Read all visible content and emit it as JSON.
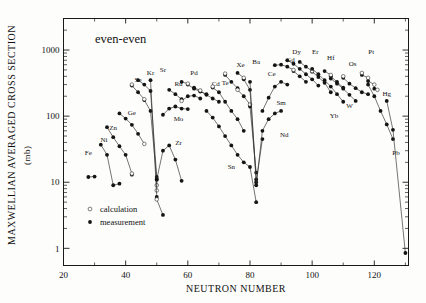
{
  "figure": {
    "title": "even-even",
    "xlabel": "NEUTRON  NUMBER",
    "ylabel": "MAXWELLIAN  AVERAGED  CROSS  SECTION",
    "yunit": "(mb)"
  },
  "legend": {
    "items": [
      {
        "marker": "open-circle",
        "label": "calculation"
      },
      {
        "marker": "filled-circle",
        "label": "measurement"
      }
    ]
  },
  "chart_data": {
    "type": "scatter",
    "title": "even-even",
    "xlabel": "NEUTRON  NUMBER",
    "ylabel": "MAXWELLIAN  AVERAGED  CROSS  SECTION (mb)",
    "xlim": [
      20,
      131
    ],
    "ylim": [
      0.55,
      3000
    ],
    "yscale": "log",
    "xticks": [
      20,
      40,
      60,
      80,
      100,
      120
    ],
    "yticks": [
      1,
      10,
      100,
      1000
    ],
    "grid": false,
    "legend_position": "lower-left-inside",
    "series": [
      {
        "name": "Fe",
        "label_x": 28,
        "label_y": 26,
        "measurement": [
          [
            28,
            12.0
          ],
          [
            30,
            12.2
          ]
        ],
        "calculation": []
      },
      {
        "name": "Ni",
        "label_x": 33,
        "label_y": 40,
        "measurement": [
          [
            32,
            37.0
          ],
          [
            34,
            26.0
          ],
          [
            36,
            9.0
          ],
          [
            38,
            9.5
          ]
        ],
        "calculation": []
      },
      {
        "name": "Zn",
        "label_x": 36,
        "label_y": 62,
        "measurement": [
          [
            34,
            68.0
          ],
          [
            36,
            48.0
          ],
          [
            38,
            35.0
          ],
          [
            40,
            26.0
          ],
          [
            42,
            13.0
          ]
        ],
        "calculation": [
          [
            42,
            13.5
          ]
        ]
      },
      {
        "name": "Ge",
        "label_x": 42,
        "label_y": 105,
        "measurement": [
          [
            38,
            110.0
          ],
          [
            40,
            92.0
          ],
          [
            42,
            74.0
          ],
          [
            44,
            54.0
          ]
        ],
        "calculation": [
          [
            46,
            38.0
          ]
        ]
      },
      {
        "name": "Se",
        "label_x": 44,
        "label_y": 330,
        "measurement": [
          [
            42,
            290.0
          ],
          [
            44,
            230.0
          ],
          [
            46,
            175.0
          ],
          [
            48,
            120.0
          ],
          [
            50,
            11.0
          ]
        ],
        "calculation": [
          [
            42,
            300.0
          ],
          [
            46,
            180.0
          ],
          [
            50,
            9.0
          ]
        ]
      },
      {
        "name": "Kr",
        "label_x": 48,
        "label_y": 420,
        "measurement": [
          [
            44,
            350.0
          ],
          [
            46,
            300.0
          ],
          [
            48,
            240.0
          ],
          [
            50,
            12.0
          ]
        ],
        "calculation": [
          [
            50,
            7.5
          ]
        ]
      },
      {
        "name": "Sr",
        "label_x": 52,
        "label_y": 470,
        "measurement": [
          [
            48,
            350.0
          ],
          [
            50,
            6.0
          ],
          [
            52,
            3.2
          ]
        ],
        "calculation": [
          [
            50,
            5.5
          ]
        ]
      },
      {
        "name": "Zr",
        "label_x": 57,
        "label_y": 36,
        "measurement": [
          [
            50,
            11.0
          ],
          [
            52,
            30.0
          ],
          [
            54,
            36.0
          ],
          [
            56,
            22.0
          ],
          [
            58,
            10.5
          ]
        ],
        "calculation": []
      },
      {
        "name": "Mo",
        "label_x": 57,
        "label_y": 85,
        "measurement": [
          [
            52,
            105.0
          ],
          [
            54,
            130.0
          ],
          [
            56,
            140.0
          ],
          [
            58,
            130.0
          ],
          [
            60,
            128.0
          ]
        ],
        "calculation": []
      },
      {
        "name": "Ru",
        "label_x": 57,
        "label_y": 290,
        "measurement": [
          [
            54,
            250.0
          ],
          [
            56,
            215.0
          ],
          [
            58,
            180.0
          ],
          [
            60,
            200.0
          ],
          [
            62,
            205.0
          ],
          [
            64,
            185.0
          ]
        ],
        "calculation": [
          [
            58,
            170.0
          ]
        ]
      },
      {
        "name": "Pd",
        "label_x": 62,
        "label_y": 420,
        "measurement": [
          [
            58,
            330.0
          ],
          [
            60,
            300.0
          ],
          [
            62,
            260.0
          ],
          [
            64,
            235.0
          ],
          [
            66,
            215.0
          ]
        ],
        "calculation": [
          [
            60,
            310.0
          ]
        ]
      },
      {
        "name": "Cd",
        "label_x": 69,
        "label_y": 290,
        "measurement": [
          [
            62,
            270.0
          ],
          [
            64,
            240.0
          ],
          [
            66,
            210.0
          ],
          [
            68,
            185.0
          ],
          [
            70,
            165.0
          ]
        ],
        "calculation": [
          [
            64,
            245.0
          ]
        ]
      },
      {
        "name": "Te",
        "label_x": 72,
        "label_y": 300,
        "measurement": [
          [
            68,
            270.0
          ],
          [
            70,
            230.0
          ],
          [
            72,
            165.0
          ],
          [
            74,
            120.0
          ],
          [
            76,
            90.0
          ],
          [
            78,
            60.0
          ]
        ],
        "calculation": [
          [
            68,
            280.0
          ]
        ]
      },
      {
        "name": "Sn",
        "label_x": 74,
        "label_y": 16,
        "measurement": [
          [
            66,
            120.0
          ],
          [
            68,
            95.0
          ],
          [
            70,
            70.0
          ],
          [
            72,
            50.0
          ],
          [
            74,
            36.0
          ],
          [
            76,
            26.0
          ],
          [
            78,
            20.0
          ],
          [
            80,
            17.0
          ],
          [
            82,
            5.0
          ]
        ],
        "calculation": []
      },
      {
        "name": "Xe",
        "label_x": 77,
        "label_y": 560,
        "measurement": [
          [
            72,
            420.0
          ],
          [
            74,
            330.0
          ],
          [
            76,
            265.0
          ],
          [
            78,
            200.0
          ],
          [
            80,
            140.0
          ],
          [
            82,
            14.0
          ]
        ],
        "calculation": [
          [
            72,
            440.0
          ],
          [
            76,
            250.0
          ],
          [
            80,
            150.0
          ]
        ]
      },
      {
        "name": "Ba",
        "label_x": 82,
        "label_y": 620,
        "measurement": [
          [
            76,
            450.0
          ],
          [
            78,
            360.0
          ],
          [
            80,
            250.0
          ],
          [
            82,
            11.0
          ]
        ],
        "calculation": [
          [
            78,
            380.0
          ]
        ]
      },
      {
        "name": "Ce",
        "label_x": 87,
        "label_y": 400,
        "measurement": [
          [
            80,
            330.0
          ],
          [
            82,
            10.0
          ],
          [
            84,
            45.0
          ]
        ],
        "calculation": []
      },
      {
        "name": "Nd",
        "label_x": 91,
        "label_y": 48,
        "measurement": [
          [
            82,
            9.0
          ],
          [
            84,
            60.0
          ],
          [
            86,
            90.0
          ],
          [
            88,
            110.0
          ],
          [
            90,
            120.0
          ]
        ],
        "calculation": []
      },
      {
        "name": "Sm",
        "label_x": 90,
        "label_y": 150,
        "measurement": [
          [
            84,
            120.0
          ],
          [
            86,
            190.0
          ],
          [
            88,
            280.0
          ],
          [
            90,
            330.0
          ],
          [
            92,
            300.0
          ]
        ],
        "calculation": []
      },
      {
        "name": "Gd",
        "label_x": 93,
        "label_y": 660,
        "measurement": [
          [
            88,
            590.0
          ],
          [
            90,
            600.0
          ],
          [
            92,
            560.0
          ],
          [
            94,
            480.0
          ],
          [
            96,
            400.0
          ],
          [
            98,
            330.0
          ]
        ],
        "calculation": [
          [
            94,
            500.0
          ]
        ]
      },
      {
        "name": "Dy",
        "label_x": 95,
        "label_y": 880,
        "measurement": [
          [
            92,
            700.0
          ],
          [
            94,
            620.0
          ],
          [
            96,
            520.0
          ],
          [
            98,
            430.0
          ],
          [
            100,
            360.0
          ],
          [
            102,
            290.0
          ]
        ],
        "calculation": []
      },
      {
        "name": "Er",
        "label_x": 101,
        "label_y": 880,
        "measurement": [
          [
            96,
            660.0
          ],
          [
            98,
            560.0
          ],
          [
            100,
            470.0
          ],
          [
            102,
            390.0
          ],
          [
            104,
            320.0
          ],
          [
            106,
            230.0
          ]
        ],
        "calculation": [
          [
            100,
            480.0
          ]
        ]
      },
      {
        "name": "Yb",
        "label_x": 107,
        "label_y": 95,
        "measurement": [
          [
            100,
            520.0
          ],
          [
            102,
            430.0
          ],
          [
            104,
            350.0
          ],
          [
            106,
            280.0
          ],
          [
            108,
            215.0
          ],
          [
            110,
            165.0
          ]
        ],
        "calculation": []
      },
      {
        "name": "Hf",
        "label_x": 106,
        "label_y": 700,
        "measurement": [
          [
            104,
            480.0
          ],
          [
            106,
            400.0
          ],
          [
            108,
            330.0
          ],
          [
            110,
            270.0
          ]
        ],
        "calculation": [
          [
            106,
            420.0
          ]
        ]
      },
      {
        "name": "W",
        "label_x": 112,
        "label_y": 135,
        "measurement": [
          [
            106,
            370.0
          ],
          [
            108,
            310.0
          ],
          [
            110,
            260.0
          ],
          [
            112,
            210.0
          ],
          [
            114,
            170.0
          ]
        ],
        "calculation": []
      },
      {
        "name": "Os",
        "label_x": 113,
        "label_y": 580,
        "measurement": [
          [
            110,
            380.0
          ],
          [
            112,
            310.0
          ],
          [
            114,
            265.0
          ],
          [
            116,
            230.0
          ],
          [
            118,
            215.0
          ]
        ],
        "calculation": [
          [
            110,
            400.0
          ]
        ]
      },
      {
        "name": "Pt",
        "label_x": 119,
        "label_y": 880,
        "measurement": [
          [
            116,
            420.0
          ],
          [
            118,
            340.0
          ],
          [
            120,
            260.0
          ]
        ],
        "calculation": [
          [
            116,
            450.0
          ],
          [
            118,
            380.0
          ],
          [
            120,
            300.0
          ],
          [
            121,
            250.0
          ]
        ]
      },
      {
        "name": "Hg",
        "label_x": 124,
        "label_y": 200,
        "measurement": [
          [
            118,
            300.0
          ],
          [
            120,
            200.0
          ],
          [
            122,
            120.0
          ],
          [
            124,
            75.0
          ],
          [
            126,
            45.0
          ]
        ],
        "calculation": []
      },
      {
        "name": "Pb",
        "label_x": 127,
        "label_y": 26,
        "measurement": [
          [
            124,
            170.0
          ],
          [
            126,
            62.0
          ],
          [
            130,
            0.85
          ]
        ],
        "calculation": []
      }
    ]
  }
}
